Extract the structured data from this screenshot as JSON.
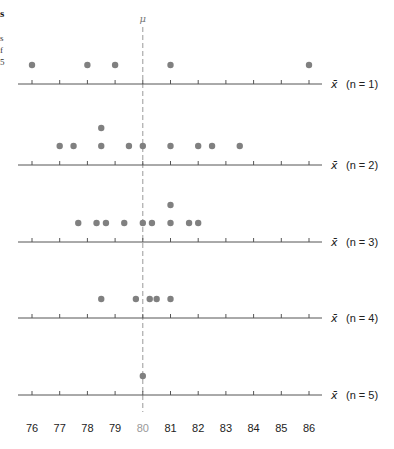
{
  "caption_fragments": [
    "s",
    "s",
    "f",
    "5"
  ],
  "mu_label": "μ",
  "xbar_label": "x̄",
  "chart_data": {
    "type": "scatter",
    "xlabel": "x̄",
    "ylabel": "",
    "xlim": [
      76,
      86
    ],
    "tick_labels": [
      "76",
      "77",
      "78",
      "79",
      "80",
      "81",
      "82",
      "83",
      "84",
      "85",
      "86"
    ],
    "highlight_tick": "80",
    "mean_line": {
      "label": "μ",
      "value": 80,
      "style": "dashed"
    },
    "grid": false,
    "series": [
      {
        "name": "n = 1",
        "label": "(n = 1)",
        "values": [
          76,
          78,
          79,
          81,
          86
        ]
      },
      {
        "name": "n = 2",
        "label": "(n = 2)",
        "values": [
          77,
          77.5,
          78.5,
          78.5,
          79.5,
          80,
          81,
          82,
          82.5,
          83.5
        ]
      },
      {
        "name": "n = 3",
        "label": "(n = 3)",
        "values": [
          77.67,
          78.33,
          78.67,
          79.33,
          80,
          80.33,
          81,
          81,
          81.67,
          82
        ]
      },
      {
        "name": "n = 4",
        "label": "(n = 4)",
        "values": [
          78.5,
          79.75,
          80.25,
          80.5,
          81
        ]
      },
      {
        "name": "n = 5",
        "label": "(n = 5)",
        "values": [
          80
        ]
      }
    ]
  },
  "colors": {
    "dot": "#808080",
    "axis": "#555555",
    "mean_line": "#999999",
    "highlight_tick": "#999999",
    "text": "#222222"
  }
}
